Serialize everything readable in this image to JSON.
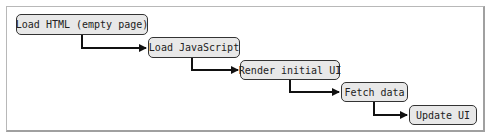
{
  "diagram": {
    "type": "waterfall-flow",
    "steps": [
      {
        "label": "Load HTML (empty page)"
      },
      {
        "label": "Load JavaScript"
      },
      {
        "label": "Render initial UI"
      },
      {
        "label": "Fetch data"
      },
      {
        "label": "Update UI"
      }
    ],
    "colors": {
      "box_fill": "#e8e8e8",
      "box_border": "#333333",
      "arrow": "#111111",
      "frame_border": "#b8b8b8"
    }
  }
}
